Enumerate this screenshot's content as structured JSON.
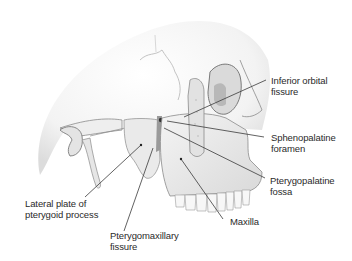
{
  "diagram": {
    "labels": [
      {
        "id": "inferior-orbital-fissure",
        "lines": [
          "Inferior orbital",
          "fissure"
        ]
      },
      {
        "id": "sphenopalatine-foramen",
        "lines": [
          "Sphenopalatine",
          "foramen"
        ]
      },
      {
        "id": "pterygopalatine-fossa",
        "lines": [
          "Pterygopalatine",
          "fossa"
        ]
      },
      {
        "id": "maxilla",
        "lines": [
          "Maxilla"
        ]
      },
      {
        "id": "pterygomaxillary-fissure",
        "lines": [
          "Pterygomaxillary",
          "fissure"
        ]
      },
      {
        "id": "lateral-plate",
        "lines": [
          "Lateral plate of",
          "pterygoid process"
        ]
      }
    ],
    "colors": {
      "background": "#ffffff",
      "bone": "#ececec",
      "bone_shadow": "#c8c8c8",
      "outline": "#8a8a8a",
      "leader": "#3a3a3a",
      "text": "#2a2a2a"
    }
  }
}
